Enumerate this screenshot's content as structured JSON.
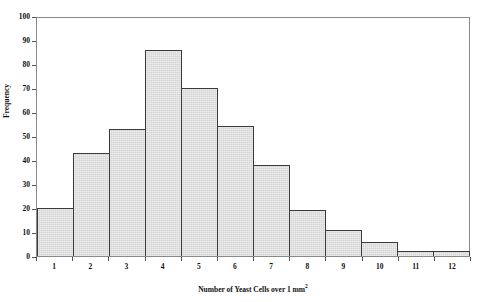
{
  "chart_data": {
    "type": "bar",
    "title": "",
    "xlabel": "Number of Yeast Cells over 1 mm",
    "xlabel_superscript": "2",
    "ylabel": "Frequency",
    "categories": [
      "1",
      "2",
      "3",
      "4",
      "5",
      "6",
      "7",
      "8",
      "9",
      "10",
      "11",
      "12"
    ],
    "values": [
      20,
      43,
      53,
      86,
      70,
      54,
      38,
      19,
      11,
      6,
      2,
      2
    ],
    "ylim": [
      0,
      100
    ],
    "ytick_labels": [
      "0",
      "10",
      "20",
      "30",
      "40",
      "50",
      "60",
      "70",
      "80",
      "90",
      "100"
    ],
    "ytick_values": [
      0,
      10,
      20,
      30,
      40,
      50,
      60,
      70,
      80,
      90,
      100
    ],
    "grid": false,
    "legend": null,
    "bar_fill_color": "#d4d4d4",
    "bar_edge_color": "#3a3a3a",
    "frame_color": "#8a8a8a",
    "background_color": "#ffffff"
  }
}
